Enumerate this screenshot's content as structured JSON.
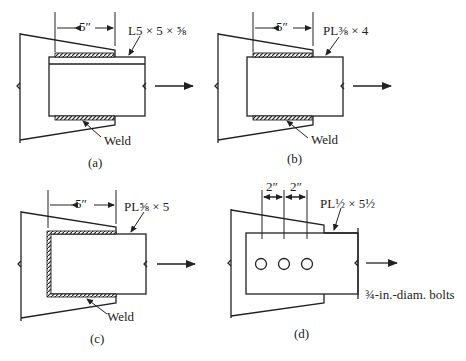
{
  "panels": {
    "a": {
      "caption": "(a)",
      "dimension": "5″",
      "member_label": "L5 × 5 × ⅝",
      "weld_label": "Weld",
      "connection": "weld"
    },
    "b": {
      "caption": "(b)",
      "dimension": "5″",
      "member_label": "PL⅜ × 4",
      "weld_label": "Weld",
      "connection": "weld"
    },
    "c": {
      "caption": "(c)",
      "dimension": "5″",
      "member_label": "PL⅝ × 5",
      "weld_label": "Weld",
      "connection": "weld (three sides)"
    },
    "d": {
      "caption": "(d)",
      "dimension_1": "2″",
      "dimension_2": "2″",
      "member_label": "PL½ × 5½",
      "bolt_label": "¾-in.-diam. bolts",
      "bolt_count": 3,
      "connection": "bolts"
    }
  },
  "colors": {
    "line": "#222222",
    "background": "#ffffff"
  }
}
